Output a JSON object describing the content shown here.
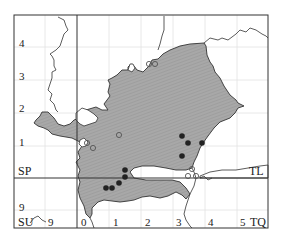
{
  "map": {
    "grid_squares": {
      "top_left": "SP",
      "top_right": "TL",
      "bottom_left": "SU",
      "bottom_right": "TQ"
    },
    "y_ticks_upper": [
      "4",
      "3",
      "2",
      "1"
    ],
    "y_tick_lower": "9",
    "x_tick_left": "9",
    "x_ticks_right": [
      "0",
      "1",
      "2",
      "3",
      "4",
      "5"
    ],
    "colors": {
      "region_fill": "#a8a8a8",
      "outline": "#333333",
      "grid": "#e2e2e2",
      "filled_dot": "#222222",
      "open_dot_stroke": "#555555"
    },
    "open_circle_records": [
      {
        "x": 149,
        "y": 64
      },
      {
        "x": 155,
        "y": 64
      },
      {
        "x": 119,
        "y": 135
      },
      {
        "x": 87,
        "y": 143
      },
      {
        "x": 93,
        "y": 148
      },
      {
        "x": 188,
        "y": 176
      },
      {
        "x": 192,
        "y": 169
      },
      {
        "x": 196,
        "y": 176
      }
    ],
    "filled_dot_records": [
      {
        "x": 182,
        "y": 136
      },
      {
        "x": 188,
        "y": 143
      },
      {
        "x": 202,
        "y": 143
      },
      {
        "x": 182,
        "y": 156
      },
      {
        "x": 125,
        "y": 170
      },
      {
        "x": 125,
        "y": 177
      },
      {
        "x": 119,
        "y": 183
      },
      {
        "x": 106,
        "y": 188
      },
      {
        "x": 112,
        "y": 188
      }
    ]
  }
}
